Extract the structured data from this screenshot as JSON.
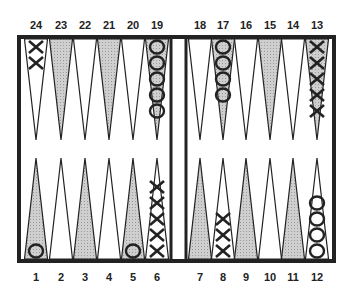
{
  "colors": {
    "shaded": "#c4c4c4",
    "frame": "#222222",
    "background": "#ffffff",
    "ink": "#222222"
  },
  "board": {
    "top_points": [
      24,
      23,
      22,
      21,
      20,
      19,
      18,
      17,
      16,
      15,
      14,
      13
    ],
    "bottom_points": [
      1,
      2,
      3,
      4,
      5,
      6,
      7,
      8,
      9,
      10,
      11,
      12
    ],
    "shaded_top": [
      23,
      21,
      19,
      17,
      15,
      13
    ],
    "shaded_bottom": [
      1,
      3,
      5,
      7,
      9,
      11
    ]
  },
  "checkers": [
    {
      "point": 24,
      "player": "X",
      "count": 2
    },
    {
      "point": 19,
      "player": "O",
      "count": 5
    },
    {
      "point": 17,
      "player": "O",
      "count": 4
    },
    {
      "point": 13,
      "player": "X",
      "count": 5
    },
    {
      "point": 1,
      "player": "O",
      "count": 1
    },
    {
      "point": 5,
      "player": "O",
      "count": 1
    },
    {
      "point": 6,
      "player": "X",
      "count": 5
    },
    {
      "point": 8,
      "player": "X",
      "count": 3
    },
    {
      "point": 12,
      "player": "O",
      "count": 4
    }
  ],
  "labels": {
    "p1": "1",
    "p2": "2",
    "p3": "3",
    "p4": "4",
    "p5": "5",
    "p6": "6",
    "p7": "7",
    "p8": "8",
    "p9": "9",
    "p10": "10",
    "p11": "11",
    "p12": "12",
    "p13": "13",
    "p14": "14",
    "p15": "15",
    "p16": "16",
    "p17": "17",
    "p18": "18",
    "p19": "19",
    "p20": "20",
    "p21": "21",
    "p22": "22",
    "p23": "23",
    "p24": "24"
  }
}
